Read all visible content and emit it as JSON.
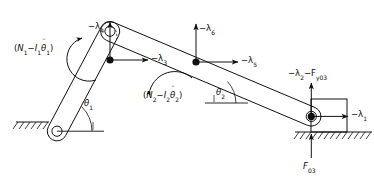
{
  "diagram": {
    "type": "mechanism-free-body-diagram",
    "stroke_color": "#111111",
    "background": "#ffffff",
    "labels": {
      "moment1": {
        "open": "(",
        "n": "N",
        "n_sub": "1",
        "minus": "−",
        "i": "I",
        "i_sub": "1",
        "theta": "θ",
        "theta_sub": "1",
        "dots": "¨",
        "close": ")"
      },
      "moment2": {
        "open": "(",
        "n": "N",
        "n_sub": "2",
        "minus": "−",
        "i": "I",
        "i_sub": "2",
        "theta": "θ",
        "theta_sub": "2",
        "dots": "¨",
        "close": ")"
      },
      "lambda4": {
        "text": "−λ",
        "sub": "4"
      },
      "lambda3": {
        "text": "−λ",
        "sub": "3"
      },
      "lambda6": {
        "text": "−λ",
        "sub": "6"
      },
      "lambda5": {
        "text": "−λ",
        "sub": "5"
      },
      "lambda1": {
        "text": "−λ",
        "sub": "1"
      },
      "lambda2_fy03": {
        "text": "−λ",
        "sub": "2",
        "text2": "−F",
        "sub2": "y03"
      },
      "f03": {
        "text": "F",
        "sub": "03"
      },
      "theta1": {
        "text": "θ",
        "sub": "1"
      },
      "theta2": {
        "text": "θ",
        "sub": "2"
      }
    },
    "nodes": [
      {
        "name": "ground-pivot-joint",
        "x": 57,
        "y": 118
      },
      {
        "name": "crank-top-joint",
        "x": 110,
        "y": 18
      },
      {
        "name": "coupler-mid-joint",
        "x": 196,
        "y": 62
      },
      {
        "name": "slider-pin-joint",
        "x": 311,
        "y": 116
      }
    ],
    "forces": [
      {
        "name": "lambda4",
        "at": "crank-lower-joint",
        "direction": "up"
      },
      {
        "name": "lambda3",
        "at": "crank-lower-joint",
        "direction": "right"
      },
      {
        "name": "lambda6",
        "at": "coupler-mid-joint",
        "direction": "up"
      },
      {
        "name": "lambda5",
        "at": "coupler-mid-joint",
        "direction": "right"
      },
      {
        "name": "lambda1",
        "at": "slider-pin-joint",
        "direction": "right"
      },
      {
        "name": "lambda2-fy03",
        "at": "slider-pin-joint",
        "direction": "up"
      },
      {
        "name": "f03",
        "at": "ground-contact",
        "direction": "up"
      }
    ],
    "moments": [
      {
        "name": "moment1",
        "at": "crank",
        "sense": "counterclockwise"
      },
      {
        "name": "moment2",
        "at": "coupler",
        "sense": "counterclockwise"
      }
    ]
  }
}
